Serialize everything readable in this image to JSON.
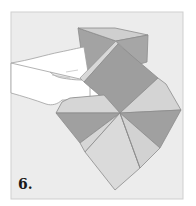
{
  "illustration": {
    "subject": "origami folding step",
    "step_label": "6.",
    "colors": {
      "frame_background": "#ececec",
      "frame_border": "#c8c8c8",
      "paper_dark": "#9a9a9a",
      "paper_mid": "#aaaaaa",
      "paper_light": "#d4d4d4",
      "paper_lightest": "#dedede",
      "hand_fill": "#ffffff",
      "outline": "#8c8c8c",
      "hand_outline": "#a0a0a0"
    }
  }
}
